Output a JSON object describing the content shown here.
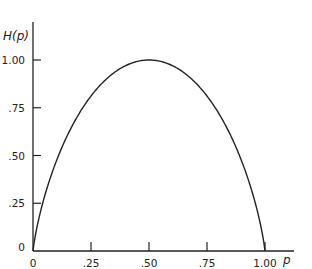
{
  "chart_data": {
    "type": "line",
    "title": "",
    "xlabel": "p",
    "ylabel": "H(p)",
    "xlim": [
      0,
      1
    ],
    "ylim": [
      0,
      1
    ],
    "x_ticks": [
      "0",
      ".25",
      ".50",
      ".75",
      "1.00"
    ],
    "y_ticks": [
      "0",
      ".25",
      ".50",
      ".75",
      "1.00"
    ],
    "grid": false,
    "legend": null,
    "series": [
      {
        "name": "H(p) = -p log2 p - (1-p) log2 (1-p)",
        "x": [
          0,
          0.05,
          0.1,
          0.2,
          0.3,
          0.4,
          0.5,
          0.6,
          0.7,
          0.8,
          0.9,
          0.95,
          1.0
        ],
        "y": [
          0,
          0.286,
          0.469,
          0.722,
          0.881,
          0.971,
          1.0,
          0.971,
          0.881,
          0.722,
          0.469,
          0.286,
          0
        ]
      }
    ]
  },
  "axes": {
    "xlabel": "p",
    "ylabel": "H(p)",
    "x_tick_labels": [
      "0",
      ".25",
      ".50",
      ".75",
      "1.00"
    ],
    "y_tick_labels": [
      "0",
      ".25",
      ".50",
      ".75",
      "1.00"
    ]
  }
}
